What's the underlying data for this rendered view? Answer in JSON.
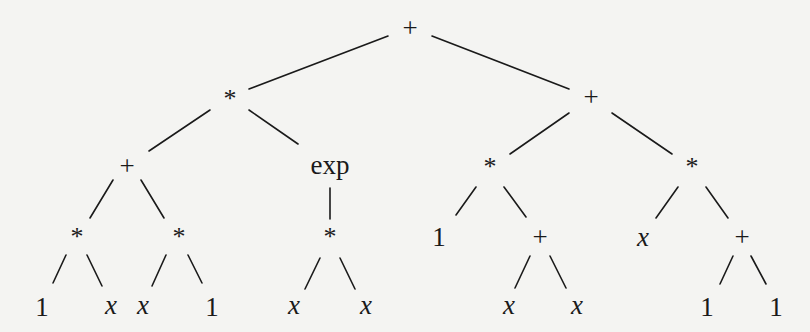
{
  "diagram": {
    "type": "expression-tree",
    "colors": {
      "background": "#f4f4f2",
      "ink": "#1a1a1a"
    },
    "nodes": [
      {
        "id": "n0",
        "label": "+",
        "kind": "op",
        "x": 410,
        "y": 28
      },
      {
        "id": "n1",
        "label": "*",
        "kind": "op",
        "x": 230,
        "y": 99
      },
      {
        "id": "n2",
        "label": "+",
        "kind": "op",
        "x": 591,
        "y": 97
      },
      {
        "id": "n3",
        "label": "+",
        "kind": "op",
        "x": 127,
        "y": 166
      },
      {
        "id": "n4",
        "label": "exp",
        "kind": "fn",
        "x": 330,
        "y": 165
      },
      {
        "id": "n5",
        "label": "*",
        "kind": "op",
        "x": 490,
        "y": 167
      },
      {
        "id": "n6",
        "label": "*",
        "kind": "op",
        "x": 692,
        "y": 167
      },
      {
        "id": "n7",
        "label": "*",
        "kind": "op",
        "x": 77,
        "y": 237
      },
      {
        "id": "n8",
        "label": "*",
        "kind": "op",
        "x": 179,
        "y": 237
      },
      {
        "id": "n9",
        "label": "*",
        "kind": "op",
        "x": 330,
        "y": 237
      },
      {
        "id": "n10",
        "label": "1",
        "kind": "num",
        "x": 439,
        "y": 237
      },
      {
        "id": "n11",
        "label": "+",
        "kind": "op",
        "x": 540,
        "y": 237
      },
      {
        "id": "n12",
        "label": "x",
        "kind": "var",
        "x": 643,
        "y": 237
      },
      {
        "id": "n13",
        "label": "+",
        "kind": "op",
        "x": 742,
        "y": 237
      },
      {
        "id": "n14",
        "label": "1",
        "kind": "num",
        "x": 42,
        "y": 307
      },
      {
        "id": "n15",
        "label": "x",
        "kind": "var",
        "x": 111,
        "y": 305
      },
      {
        "id": "n16",
        "label": "x",
        "kind": "var",
        "x": 143,
        "y": 305
      },
      {
        "id": "n17",
        "label": "1",
        "kind": "num",
        "x": 212,
        "y": 307
      },
      {
        "id": "n18",
        "label": "x",
        "kind": "var",
        "x": 294,
        "y": 305
      },
      {
        "id": "n19",
        "label": "x",
        "kind": "var",
        "x": 366,
        "y": 305
      },
      {
        "id": "n20",
        "label": "x",
        "kind": "var",
        "x": 509,
        "y": 305
      },
      {
        "id": "n21",
        "label": "x",
        "kind": "var",
        "x": 577,
        "y": 305
      },
      {
        "id": "n22",
        "label": "1",
        "kind": "num",
        "x": 707,
        "y": 307
      },
      {
        "id": "n23",
        "label": "1",
        "kind": "num",
        "x": 776,
        "y": 307
      }
    ],
    "edges": [
      {
        "from": "n0",
        "to": "n1",
        "x1": 388,
        "y1": 36,
        "x2": 249,
        "y2": 89
      },
      {
        "from": "n0",
        "to": "n2",
        "x1": 432,
        "y1": 36,
        "x2": 569,
        "y2": 89
      },
      {
        "from": "n1",
        "to": "n3",
        "x1": 210,
        "y1": 110,
        "x2": 149,
        "y2": 151
      },
      {
        "from": "n1",
        "to": "n4",
        "x1": 249,
        "y1": 110,
        "x2": 298,
        "y2": 144
      },
      {
        "from": "n2",
        "to": "n5",
        "x1": 569,
        "y1": 113,
        "x2": 510,
        "y2": 154
      },
      {
        "from": "n2",
        "to": "n6",
        "x1": 612,
        "y1": 113,
        "x2": 672,
        "y2": 154
      },
      {
        "from": "n3",
        "to": "n7",
        "x1": 113,
        "y1": 180,
        "x2": 90,
        "y2": 218
      },
      {
        "from": "n3",
        "to": "n8",
        "x1": 141,
        "y1": 180,
        "x2": 164,
        "y2": 218
      },
      {
        "from": "n4",
        "to": "n9",
        "x1": 330,
        "y1": 188,
        "x2": 330,
        "y2": 219
      },
      {
        "from": "n5",
        "to": "n10",
        "x1": 476,
        "y1": 187,
        "x2": 456,
        "y2": 215
      },
      {
        "from": "n5",
        "to": "n11",
        "x1": 504,
        "y1": 187,
        "x2": 526,
        "y2": 217
      },
      {
        "from": "n6",
        "to": "n12",
        "x1": 678,
        "y1": 187,
        "x2": 656,
        "y2": 218
      },
      {
        "from": "n6",
        "to": "n13",
        "x1": 706,
        "y1": 187,
        "x2": 728,
        "y2": 218
      },
      {
        "from": "n7",
        "to": "n14",
        "x1": 66,
        "y1": 255,
        "x2": 53,
        "y2": 283
      },
      {
        "from": "n7",
        "to": "n15",
        "x1": 87,
        "y1": 255,
        "x2": 102,
        "y2": 286
      },
      {
        "from": "n8",
        "to": "n16",
        "x1": 166,
        "y1": 255,
        "x2": 152,
        "y2": 286
      },
      {
        "from": "n8",
        "to": "n17",
        "x1": 188,
        "y1": 255,
        "x2": 202,
        "y2": 283
      },
      {
        "from": "n9",
        "to": "n18",
        "x1": 320,
        "y1": 258,
        "x2": 305,
        "y2": 289
      },
      {
        "from": "n9",
        "to": "n19",
        "x1": 340,
        "y1": 258,
        "x2": 355,
        "y2": 289
      },
      {
        "from": "n11",
        "to": "n20",
        "x1": 530,
        "y1": 256,
        "x2": 515,
        "y2": 288
      },
      {
        "from": "n11",
        "to": "n21",
        "x1": 550,
        "y1": 256,
        "x2": 566,
        "y2": 288
      },
      {
        "from": "n13",
        "to": "n22",
        "x1": 733,
        "y1": 256,
        "x2": 720,
        "y2": 284
      },
      {
        "from": "n13",
        "to": "n23",
        "x1": 751,
        "y1": 256,
        "x2": 766,
        "y2": 284
      }
    ]
  }
}
